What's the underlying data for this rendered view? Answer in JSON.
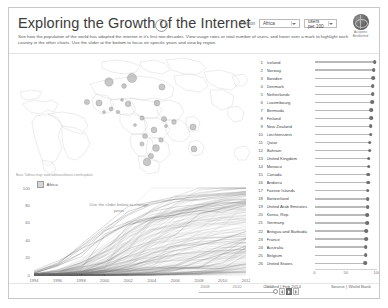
{
  "header": {
    "title": "Exploring the Growth of the Internet",
    "info_icon": "i",
    "subtitle": "See how the population of the world has adopted the internet in it's first two decades. View usage rates or total number of users, and hover over a mark to highlight each country in the other charts. Use the slider at the bottom to focus on specific years and view by region.",
    "region_label": "Region",
    "region_value": "Africa",
    "metric_value": "users per 100",
    "brand_line1": "Accipiens",
    "brand_line2": "Bestbehind"
  },
  "map": {
    "credit": "Basic Tableau map: www.tableausoftware.com/mapdata",
    "bubbles": [
      {
        "cx": 118,
        "cy": 22,
        "r": 4.6
      },
      {
        "cx": 95,
        "cy": 26,
        "r": 4.2
      },
      {
        "cx": 148,
        "cy": 31,
        "r": 3.1
      },
      {
        "cx": 110,
        "cy": 30,
        "r": 2.4
      },
      {
        "cx": 73,
        "cy": 46,
        "r": 2.6
      },
      {
        "cx": 85,
        "cy": 47,
        "r": 3.1
      },
      {
        "cx": 114,
        "cy": 48,
        "r": 2.8
      },
      {
        "cx": 143,
        "cy": 47,
        "r": 2.9
      },
      {
        "cx": 97,
        "cy": 53,
        "r": 2.0
      },
      {
        "cx": 104,
        "cy": 56,
        "r": 1.8
      },
      {
        "cx": 128,
        "cy": 62,
        "r": 2.2
      },
      {
        "cx": 150,
        "cy": 63,
        "r": 2.6
      },
      {
        "cx": 160,
        "cy": 66,
        "r": 2.4
      },
      {
        "cx": 179,
        "cy": 71,
        "r": 3.1
      },
      {
        "cx": 140,
        "cy": 74,
        "r": 2.9
      },
      {
        "cx": 131,
        "cy": 80,
        "r": 2.5
      },
      {
        "cx": 147,
        "cy": 84,
        "r": 2.3
      },
      {
        "cx": 128,
        "cy": 88,
        "r": 2.1
      },
      {
        "cx": 142,
        "cy": 92,
        "r": 3.4
      },
      {
        "cx": 180,
        "cy": 93,
        "r": 3.0
      },
      {
        "cx": 137,
        "cy": 100,
        "r": 2.6
      },
      {
        "cx": 133,
        "cy": 106,
        "r": 3.8
      },
      {
        "cx": 152,
        "cy": 70,
        "r": 1.6
      },
      {
        "cx": 121,
        "cy": 69,
        "r": 1.5
      },
      {
        "cx": 108,
        "cy": 44,
        "r": 1.4
      },
      {
        "cx": 90,
        "cy": 56,
        "r": 1.5
      }
    ]
  },
  "line_chart": {
    "legend_label": "Africa",
    "hint": "Use the slider below to change years",
    "y_ticks": [
      "100",
      "80",
      "60",
      "40",
      "20",
      "0"
    ],
    "x_ticks": [
      "1994",
      "1996",
      "1998",
      "2000",
      "2002",
      "2004",
      "2006",
      "2008",
      "2010",
      "2012"
    ]
  },
  "ranking": {
    "axis_ticks": [
      "0",
      "50",
      "100"
    ],
    "rows": [
      {
        "rank": "1",
        "country": "Iceland",
        "value": 96
      },
      {
        "rank": "2",
        "country": "Norway",
        "value": 95
      },
      {
        "rank": "3",
        "country": "Sweden",
        "value": 94
      },
      {
        "rank": "4",
        "country": "Denmark",
        "value": 93
      },
      {
        "rank": "5",
        "country": "Netherlands",
        "value": 93
      },
      {
        "rank": "6",
        "country": "Luxembourg",
        "value": 92
      },
      {
        "rank": "7",
        "country": "Bermuda",
        "value": 91
      },
      {
        "rank": "8",
        "country": "Finland",
        "value": 91
      },
      {
        "rank": "9",
        "country": "New Zealand",
        "value": 90
      },
      {
        "rank": "10",
        "country": "Liechtenstein",
        "value": 90
      },
      {
        "rank": "11",
        "country": "Qatar",
        "value": 88
      },
      {
        "rank": "12",
        "country": "Bahrain",
        "value": 88
      },
      {
        "rank": "13",
        "country": "United Kingdom",
        "value": 87
      },
      {
        "rank": "14",
        "country": "Monaco",
        "value": 87
      },
      {
        "rank": "15",
        "country": "Canada",
        "value": 86
      },
      {
        "rank": "16",
        "country": "Andorra",
        "value": 86
      },
      {
        "rank": "17",
        "country": "Faeroe Islands",
        "value": 85
      },
      {
        "rank": "18",
        "country": "Switzerland",
        "value": 85
      },
      {
        "rank": "19",
        "country": "United Arab Emirates",
        "value": 85
      },
      {
        "rank": "20",
        "country": "Korea, Rep.",
        "value": 84
      },
      {
        "rank": "21",
        "country": "Germany",
        "value": 84
      },
      {
        "rank": "22",
        "country": "Antigua and Barbuda",
        "value": 83
      },
      {
        "rank": "23",
        "country": "France",
        "value": 83
      },
      {
        "rank": "24",
        "country": "Australia",
        "value": 82
      },
      {
        "rank": "25",
        "country": "Belgium",
        "value": 82
      },
      {
        "rank": "26",
        "country": "United States",
        "value": 81
      }
    ]
  },
  "slider": {
    "ticks": [
      "2008",
      "2010",
      "2012"
    ],
    "prev_icon": "prev-arrow",
    "play_icon": "play-arrow",
    "next_icon": "next-arrow"
  },
  "footer": {
    "created": "Created | Feb 2014",
    "source": "Source | World Bank"
  },
  "chart_data": [
    {
      "type": "line",
      "title": "Internet users per 100 people over time",
      "xlabel": "",
      "ylabel": "users per 100",
      "xlim": [
        1993,
        2012
      ],
      "ylim": [
        0,
        100
      ],
      "x": [
        "1994",
        "1996",
        "1998",
        "2000",
        "2002",
        "2004",
        "2006",
        "2008",
        "2010",
        "2012"
      ],
      "grid": false,
      "legend": "Africa",
      "note": "Dense spaghetti plot: one rising line per country, most curves start near 0 in 1994 and fan out to between 5 and 95 by 2012",
      "series": [
        {
          "name": "Iceland",
          "values": [
            2,
            12,
            35,
            57,
            79,
            84,
            90,
            92,
            94,
            96
          ]
        },
        {
          "name": "Norway",
          "values": [
            3,
            14,
            32,
            52,
            73,
            82,
            87,
            91,
            93,
            95
          ]
        },
        {
          "name": "Sweden",
          "values": [
            3,
            13,
            33,
            54,
            70,
            84,
            87,
            90,
            92,
            94
          ]
        },
        {
          "name": "Denmark",
          "values": [
            2,
            11,
            30,
            50,
            69,
            81,
            87,
            86,
            89,
            93
          ]
        },
        {
          "name": "Netherlands",
          "values": [
            2,
            10,
            25,
            44,
            61,
            74,
            84,
            87,
            91,
            93
          ]
        },
        {
          "name": "United States",
          "values": [
            5,
            16,
            30,
            43,
            59,
            65,
            69,
            74,
            72,
            81
          ]
        },
        {
          "name": "United Kingdom",
          "values": [
            1,
            6,
            14,
            27,
            57,
            66,
            69,
            78,
            85,
            87
          ]
        },
        {
          "name": "Germany",
          "values": [
            1,
            5,
            10,
            30,
            49,
            65,
            72,
            78,
            82,
            84
          ]
        },
        {
          "name": "France",
          "values": [
            1,
            4,
            9,
            14,
            30,
            39,
            46,
            70,
            77,
            83
          ]
        },
        {
          "name": "Korea, Rep.",
          "values": [
            1,
            4,
            7,
            45,
            59,
            73,
            78,
            81,
            83,
            84
          ]
        },
        {
          "name": "Canada",
          "values": [
            4,
            12,
            25,
            51,
            61,
            66,
            73,
            77,
            80,
            86
          ]
        },
        {
          "name": "Australia",
          "values": [
            2,
            11,
            21,
            47,
            58,
            63,
            67,
            71,
            76,
            82
          ]
        },
        {
          "name": "South Africa",
          "values": [
            0,
            2,
            4,
            5,
            7,
            9,
            8,
            8,
            24,
            41
          ]
        },
        {
          "name": "Kenya",
          "values": [
            0,
            0,
            0,
            0,
            1,
            3,
            8,
            9,
            14,
            32
          ]
        },
        {
          "name": "Nigeria",
          "values": [
            0,
            0,
            0,
            0,
            1,
            1,
            5,
            16,
            24,
            33
          ]
        },
        {
          "name": "India",
          "values": [
            0,
            0,
            0,
            1,
            2,
            2,
            3,
            4,
            8,
            13
          ]
        },
        {
          "name": "China",
          "values": [
            0,
            0,
            0,
            2,
            5,
            7,
            11,
            23,
            34,
            42
          ]
        },
        {
          "name": "Brazil",
          "values": [
            0,
            0,
            1,
            3,
            9,
            19,
            28,
            34,
            41,
            50
          ]
        }
      ]
    },
    {
      "type": "bar",
      "title": "Top countries by internet users per 100 people",
      "orientation": "horizontal",
      "xlabel": "users per 100",
      "ylabel": "",
      "xlim": [
        0,
        100
      ],
      "x_ticks": [
        0,
        50,
        100
      ],
      "categories": [
        "Iceland",
        "Norway",
        "Sweden",
        "Denmark",
        "Netherlands",
        "Luxembourg",
        "Bermuda",
        "Finland",
        "New Zealand",
        "Liechtenstein",
        "Qatar",
        "Bahrain",
        "United Kingdom",
        "Monaco",
        "Canada",
        "Andorra",
        "Faeroe Islands",
        "Switzerland",
        "United Arab Emirates",
        "Korea, Rep.",
        "Germany",
        "Antigua and Barbuda",
        "France",
        "Australia",
        "Belgium",
        "United States"
      ],
      "values": [
        96,
        95,
        94,
        93,
        93,
        92,
        91,
        91,
        90,
        90,
        88,
        88,
        87,
        87,
        86,
        86,
        85,
        85,
        85,
        84,
        84,
        83,
        83,
        82,
        82,
        81
      ]
    },
    {
      "type": "scatter",
      "title": "World map of internet adoption (Africa highlighted)",
      "note": "Proportional circle symbols sized by internet users per 100 people, plotted on a world basemap centred on Africa",
      "xlabel": "longitude",
      "ylabel": "latitude"
    }
  ]
}
